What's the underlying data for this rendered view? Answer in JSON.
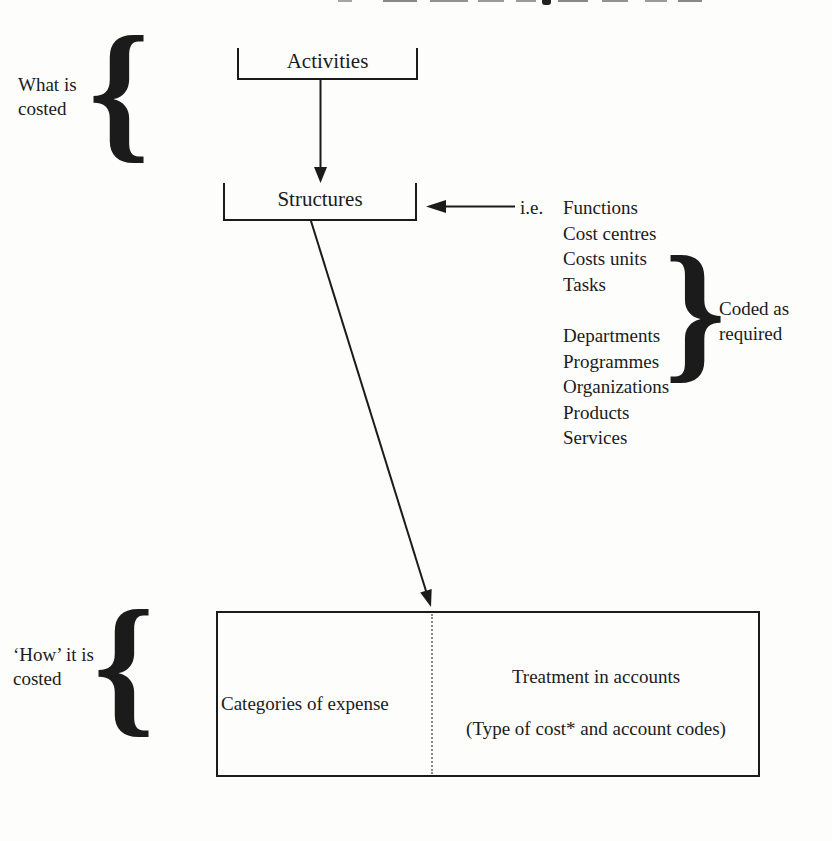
{
  "diagram": {
    "ink": "#1b1b1b",
    "labels": {
      "what_is": {
        "line1": "What is",
        "line2": "costed"
      },
      "how_it_is": {
        "line1": "‘How’ it is",
        "line2": "costed"
      },
      "coded_as": {
        "line1": "Coded as",
        "line2": "required"
      },
      "ie": "i.e."
    },
    "glyphs": {
      "left_brace": "{",
      "right_brace": "}"
    },
    "nodes": {
      "activities": "Activities",
      "structures": "Structures"
    },
    "examples": [
      "Functions",
      "Cost centres",
      "Costs units",
      "Tasks",
      "Departments",
      "Programmes",
      "Organizations",
      "Products",
      "Services"
    ],
    "bottom_box": {
      "left_cell": "Categories of expense",
      "right_cell_line1": "Treatment in accounts",
      "right_cell_line2": "(Type of cost* and account codes)"
    }
  }
}
